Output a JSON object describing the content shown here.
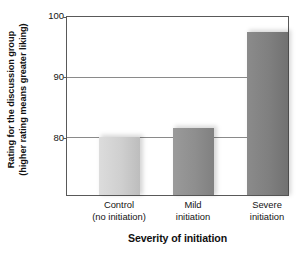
{
  "chart_data": {
    "type": "bar",
    "title": "",
    "subtitle": "",
    "xlabel": "Severity of initiation",
    "ylabel": "Rating for the discussion group (higher rating means greater liking)",
    "ylabel_line1": "Rating for the discussion group",
    "ylabel_line2": "(higher rating means greater liking)",
    "categories": [
      "Control (no initiation)",
      "Mild initiation",
      "Severe initiation"
    ],
    "category_labels": [
      {
        "line1": "Control",
        "line2": "(no initiation)"
      },
      {
        "line1": "Mild",
        "line2": "initiation"
      },
      {
        "line1": "Severe",
        "line2": "initiation"
      }
    ],
    "values": [
      80.0,
      81.6,
      97.5
    ],
    "ylim": [
      70.4,
      100
    ],
    "yticks": [
      100,
      90,
      80
    ],
    "ytick_labels": [
      "100",
      "90",
      "80"
    ],
    "grid": true,
    "grid_axis": "y",
    "legend": "none",
    "bar_colors": [
      "#cfcfcf",
      "#8e8e8e",
      "#7f7f7f"
    ],
    "bar_colors_light": [
      "#dcdcdc",
      "#9a9a9a",
      "#8b8b8b"
    ],
    "bar_colors_dark": [
      "#bdbdbd",
      "#808080",
      "#717171"
    ],
    "axis_color": "#595959",
    "grid_color": "#8a8a8a",
    "background": "#ffffff",
    "text_color": "#141414"
  }
}
